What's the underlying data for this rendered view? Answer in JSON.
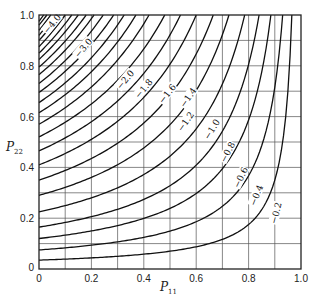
{
  "chart_data": {
    "type": "line",
    "subtype": "contour",
    "title": "",
    "xlabel": "P11",
    "ylabel": "P22",
    "xlim": [
      0,
      1.0
    ],
    "ylim": [
      0,
      1.0
    ],
    "x_ticks": [
      "0",
      "0.2",
      "0.4",
      "0.6",
      "0.8",
      "1.0"
    ],
    "y_ticks": [
      "0",
      "0.2",
      "0.4",
      "0.6",
      "0.8",
      "1.0"
    ],
    "grid": {
      "on": true,
      "step": 0.1
    },
    "contour_levels_labeled": [
      "-4.0",
      "-3.0",
      "-2.0",
      "-1.8",
      "-1.6",
      "-1.4",
      "-1.2",
      "-1.0",
      "-0.8",
      "-0.6",
      "-0.4",
      "-0.2"
    ],
    "contours": [
      {
        "level": -0.1,
        "y_at_p11_0": 0.035,
        "p11_at_top": 0.965
      },
      {
        "level": -0.2,
        "y_at_p11_0": 0.075,
        "p11_at_top": 0.93
      },
      {
        "level": -0.3,
        "y_at_p11_0": 0.12,
        "p11_at_top": 0.885
      },
      {
        "level": -0.4,
        "y_at_p11_0": 0.165,
        "p11_at_top": 0.84
      },
      {
        "level": -0.5,
        "y_at_p11_0": 0.225,
        "p11_at_top": 0.785
      },
      {
        "level": -0.6,
        "y_at_p11_0": 0.29,
        "p11_at_top": 0.725
      },
      {
        "level": -0.7,
        "y_at_p11_0": 0.35,
        "p11_at_top": 0.665
      },
      {
        "level": -0.8,
        "y_at_p11_0": 0.41,
        "p11_at_top": 0.6
      },
      {
        "level": -0.9,
        "y_at_p11_0": 0.465,
        "p11_at_top": 0.54
      },
      {
        "level": -1.0,
        "y_at_p11_0": 0.52,
        "p11_at_top": 0.48
      },
      {
        "level": -1.2,
        "y_at_p11_0": 0.57,
        "p11_at_top": 0.42
      },
      {
        "level": -1.4,
        "y_at_p11_0": 0.615,
        "p11_at_top": 0.37
      },
      {
        "level": -1.6,
        "y_at_p11_0": 0.655,
        "p11_at_top": 0.325
      },
      {
        "level": -1.8,
        "y_at_p11_0": 0.695,
        "p11_at_top": 0.285
      },
      {
        "level": -2.0,
        "y_at_p11_0": 0.73,
        "p11_at_top": 0.245
      },
      {
        "level": -2.2,
        "y_at_p11_0": 0.765,
        "p11_at_top": 0.21
      },
      {
        "level": -2.4,
        "y_at_p11_0": 0.795,
        "p11_at_top": 0.18
      },
      {
        "level": -2.6,
        "y_at_p11_0": 0.825,
        "p11_at_top": 0.15
      },
      {
        "level": -2.8,
        "y_at_p11_0": 0.85,
        "p11_at_top": 0.125
      },
      {
        "level": -3.0,
        "y_at_p11_0": 0.875,
        "p11_at_top": 0.1
      },
      {
        "level": -3.2,
        "y_at_p11_0": 0.9,
        "p11_at_top": 0.08
      },
      {
        "level": -3.4,
        "y_at_p11_0": 0.92,
        "p11_at_top": 0.06
      },
      {
        "level": -3.6,
        "y_at_p11_0": 0.94,
        "p11_at_top": 0.045
      },
      {
        "level": -3.8,
        "y_at_p11_0": 0.96,
        "p11_at_top": 0.03
      },
      {
        "level": -4.0,
        "y_at_p11_0": 0.975,
        "p11_at_top": 0.018
      }
    ],
    "labels": [
      {
        "text": "-4.0",
        "p11": 0.05,
        "p22": 0.965,
        "angle": -50
      },
      {
        "text": "-3.0",
        "p11": 0.17,
        "p22": 0.87,
        "angle": -50
      },
      {
        "text": "-2.0",
        "p11": 0.33,
        "p22": 0.745,
        "angle": -50
      },
      {
        "text": "-1.8",
        "p11": 0.4,
        "p22": 0.71,
        "angle": -50
      },
      {
        "text": "-1.6",
        "p11": 0.49,
        "p22": 0.69,
        "angle": -52
      },
      {
        "text": "-1.4",
        "p11": 0.57,
        "p22": 0.675,
        "angle": -55
      },
      {
        "text": "-1.2",
        "p11": 0.56,
        "p22": 0.58,
        "angle": -55
      },
      {
        "text": "-1.0",
        "p11": 0.66,
        "p22": 0.55,
        "angle": -58
      },
      {
        "text": "-0.8",
        "p11": 0.72,
        "p22": 0.46,
        "angle": -62
      },
      {
        "text": "-0.6",
        "p11": 0.77,
        "p22": 0.36,
        "angle": -65
      },
      {
        "text": "-0.4",
        "p11": 0.83,
        "p22": 0.29,
        "angle": -68
      },
      {
        "text": "-0.2",
        "p11": 0.905,
        "p22": 0.22,
        "angle": -75
      }
    ]
  }
}
